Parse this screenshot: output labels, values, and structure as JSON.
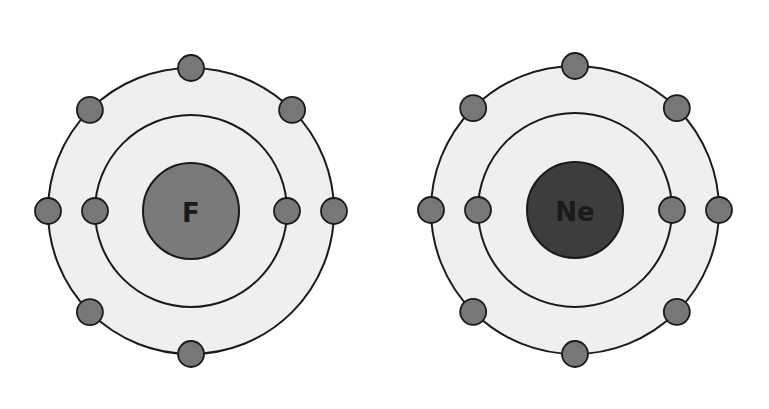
{
  "atoms": [
    {
      "symbol": "F",
      "name": "fluorine",
      "center": [
        191,
        211
      ],
      "nucleus_radius": 48,
      "nucleus_color": "#7a7a7a",
      "shells": [
        {
          "radius": 96,
          "electrons": 2,
          "angles": [
            180,
            0
          ]
        },
        {
          "radius": 143,
          "electrons": 7,
          "angles": [
            90,
            135,
            45,
            180,
            0,
            225,
            270
          ]
        }
      ]
    },
    {
      "symbol": "Ne",
      "name": "neon",
      "center": [
        575,
        210
      ],
      "nucleus_radius": 48,
      "nucleus_color": "#3d3d3d",
      "shells": [
        {
          "radius": 97,
          "electrons": 2,
          "angles": [
            180,
            0
          ]
        },
        {
          "radius": 144,
          "electrons": 8,
          "angles": [
            90,
            135,
            45,
            180,
            0,
            225,
            315,
            270
          ]
        }
      ]
    }
  ],
  "colors": {
    "shell_fill": "#efefef",
    "shell_stroke": "#1a1a1a",
    "electron_fill": "#777777"
  },
  "electron_radius": 13
}
